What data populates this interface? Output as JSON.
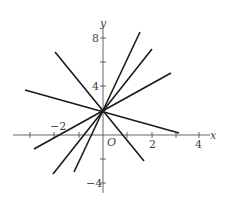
{
  "diagram": {
    "type": "coordinate-plane",
    "axes": {
      "x_label": "x",
      "y_label": "y",
      "origin_label": "O",
      "x_ticks": [
        -3,
        -2,
        -1,
        1,
        2,
        3,
        4
      ],
      "y_ticks": [
        -4,
        -2,
        2,
        4,
        6,
        8
      ],
      "x_tick_labels": [
        {
          "value": -2,
          "text": "−2"
        },
        {
          "value": 2,
          "text": "2"
        },
        {
          "value": 4,
          "text": "4"
        }
      ],
      "y_tick_labels": [
        {
          "value": 8,
          "text": "8"
        },
        {
          "value": 4,
          "text": "4"
        },
        {
          "value": -4,
          "text": "−4"
        }
      ],
      "x_range": [
        -3.7,
        4.4
      ],
      "y_range": [
        -4.8,
        8.9
      ]
    },
    "common_point": {
      "x": 0,
      "y": 2
    },
    "lines": [
      {
        "id": "line-1",
        "approx_slope": 4.3,
        "from": [
          -1.19,
          -3.08
        ],
        "to": [
          1.52,
          8.58
        ]
      },
      {
        "id": "line-2",
        "approx_slope": 2.55,
        "from": [
          -2.06,
          -3.25
        ],
        "to": [
          2.02,
          7.17
        ]
      },
      {
        "id": "line-3",
        "approx_slope": 1.12,
        "from": [
          -2.84,
          -1.17
        ],
        "to": [
          2.8,
          5.17
        ]
      },
      {
        "id": "line-4",
        "approx_slope": -2.48,
        "from": [
          -1.98,
          6.92
        ],
        "to": [
          1.69,
          -2.17
        ]
      },
      {
        "id": "line-5",
        "approx_slope": -0.56,
        "from": [
          -3.21,
          3.75
        ],
        "to": [
          3.13,
          0.17
        ]
      }
    ]
  }
}
